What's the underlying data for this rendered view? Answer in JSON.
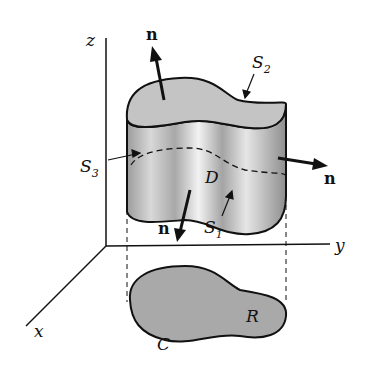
{
  "figure": {
    "axes": {
      "x": "x",
      "y": "y",
      "z": "z"
    },
    "normal_label": "n",
    "labels": {
      "S1_base": "S",
      "S1_sub": "1",
      "S2_base": "S",
      "S2_sub": "2",
      "S3_base": "S",
      "S3_sub": "3",
      "D": "D",
      "R": "R",
      "C": "C"
    },
    "colors": {
      "surface": "#c4c4c4",
      "stroke": "#111111",
      "shadow": "#9a9a9a"
    }
  }
}
